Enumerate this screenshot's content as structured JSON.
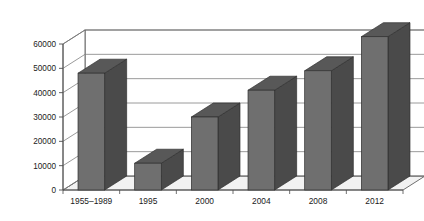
{
  "chart_data": {
    "type": "bar",
    "title": "",
    "subtitle": "",
    "xlabel": "",
    "ylabel": "",
    "categories": [
      "1955–1989",
      "1995",
      "2000",
      "2004",
      "2008",
      "2012"
    ],
    "values": [
      48000,
      11000,
      30000,
      41000,
      49000,
      63000
    ],
    "series": [
      {
        "name": "",
        "values": [
          48000,
          11000,
          30000,
          41000,
          49000,
          63000
        ]
      }
    ],
    "ylim": [
      0,
      60000
    ],
    "yticks": [
      0,
      10000,
      20000,
      30000,
      40000,
      50000,
      60000
    ],
    "ytick_labels": [
      "0",
      "10000",
      "20000",
      "30000",
      "40000",
      "50000",
      "60000"
    ],
    "grid": true,
    "grid_axis": "y",
    "legend": false,
    "legend_position": "none",
    "style": "3d-column",
    "colors": {
      "bar_front": "#6f6f6f",
      "bar_side": "#4a4a4a",
      "bar_top": "#585858",
      "wall": "#ffffff",
      "floor": "#f2f2f2",
      "grid": "#808080",
      "axis": "#4d4d4d",
      "text": "#1a1a1a",
      "background": "#ffffff"
    }
  },
  "axes": {
    "y_axis_name": "y-axis",
    "x_axis_name": "x-axis"
  }
}
